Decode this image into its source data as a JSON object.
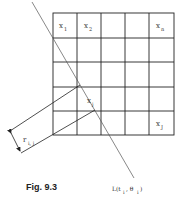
{
  "figure": {
    "caption": "Fig. 9.3",
    "grid": {
      "rows": 5,
      "cols": 5
    },
    "cells": {
      "x1": {
        "base": "x",
        "sub": "1"
      },
      "x2": {
        "base": "x",
        "sub": "2"
      },
      "xn": {
        "base": "x",
        "sub": "n"
      },
      "xj": {
        "base": "x",
        "sub": "j"
      },
      "xJ": {
        "base": "x",
        "sub": "J"
      }
    },
    "ray_label": {
      "base": "L(t",
      "sub1": "i",
      "mid": ", θ",
      "sub2": "i",
      "end": ")"
    },
    "width_label": {
      "base": "r",
      "sub": "i, j"
    }
  }
}
